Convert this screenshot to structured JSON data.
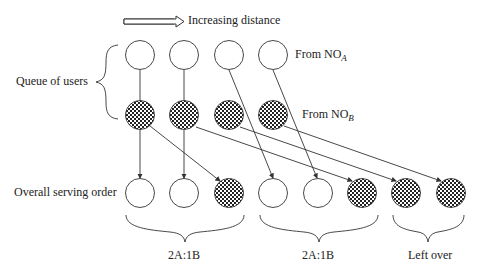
{
  "diagram": {
    "arrow_label": "Increasing distance",
    "queue_label": "Queue of users",
    "from_a_prefix": "From NO",
    "from_a_sub": "A",
    "from_b_prefix": "From NO",
    "from_b_sub": "B",
    "serving_label": "Overall serving order",
    "groups": [
      {
        "label": "2A:1B"
      },
      {
        "label": "2A:1B"
      },
      {
        "label": "Left over"
      }
    ],
    "rows": {
      "from_a": [
        "A1",
        "A2",
        "A3",
        "A4"
      ],
      "from_b": [
        "B1",
        "B2",
        "B3",
        "B4"
      ],
      "serving_order": [
        "A1",
        "A2",
        "B1",
        "A3",
        "A4",
        "B2",
        "B3",
        "B4"
      ]
    },
    "colors": {
      "stroke": "#333333",
      "fill_a": "#ffffff",
      "fill_b_pattern": "checkerboard"
    }
  }
}
